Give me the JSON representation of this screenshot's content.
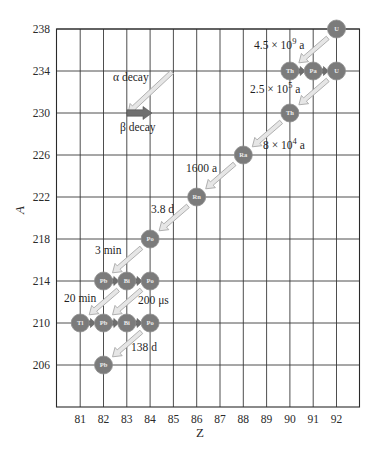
{
  "chart_data": {
    "type": "diagram",
    "xlabel": "Z",
    "ylabel": "A",
    "x_ticks": [
      81,
      82,
      83,
      84,
      85,
      86,
      87,
      88,
      89,
      90,
      91,
      92
    ],
    "y_ticks": [
      238,
      234,
      230,
      226,
      222,
      218,
      214,
      210,
      206
    ],
    "xlim": [
      80,
      93
    ],
    "ylim": [
      202,
      238
    ],
    "legend": {
      "alpha_label": "α decay",
      "beta_label": "β decay"
    },
    "nuclides": [
      {
        "symbol": "U",
        "Z": 92,
        "A": 238
      },
      {
        "symbol": "Th",
        "Z": 90,
        "A": 234
      },
      {
        "symbol": "Pa",
        "Z": 91,
        "A": 234
      },
      {
        "symbol": "U",
        "Z": 92,
        "A": 234
      },
      {
        "symbol": "Th",
        "Z": 90,
        "A": 230
      },
      {
        "symbol": "Ra",
        "Z": 88,
        "A": 226
      },
      {
        "symbol": "Rn",
        "Z": 86,
        "A": 222
      },
      {
        "symbol": "Po",
        "Z": 84,
        "A": 218
      },
      {
        "symbol": "Pb",
        "Z": 82,
        "A": 214
      },
      {
        "symbol": "Bi",
        "Z": 83,
        "A": 214
      },
      {
        "symbol": "Po",
        "Z": 84,
        "A": 214
      },
      {
        "symbol": "Tl",
        "Z": 81,
        "A": 210
      },
      {
        "symbol": "Pb",
        "Z": 82,
        "A": 210
      },
      {
        "symbol": "Bi",
        "Z": 83,
        "A": 210
      },
      {
        "symbol": "Po",
        "Z": 84,
        "A": 210
      },
      {
        "symbol": "Pb",
        "Z": 82,
        "A": 206
      }
    ],
    "alpha_decays": [
      {
        "from": [
          92,
          238
        ],
        "to": [
          90,
          234
        ],
        "half_life": "4.5 × 10⁹ a"
      },
      {
        "from": [
          92,
          234
        ],
        "to": [
          90,
          230
        ],
        "half_life": "2.5 × 10⁵ a"
      },
      {
        "from": [
          90,
          230
        ],
        "to": [
          88,
          226
        ],
        "half_life": "8 × 10⁴ a"
      },
      {
        "from": [
          88,
          226
        ],
        "to": [
          86,
          222
        ],
        "half_life": "1600 a"
      },
      {
        "from": [
          86,
          222
        ],
        "to": [
          84,
          218
        ],
        "half_life": "3.8 d"
      },
      {
        "from": [
          84,
          218
        ],
        "to": [
          82,
          214
        ],
        "half_life": "3 min"
      },
      {
        "from": [
          83,
          214
        ],
        "to": [
          81,
          210
        ],
        "half_life": "20 min"
      },
      {
        "from": [
          84,
          214
        ],
        "to": [
          82,
          210
        ],
        "half_life": "200 μs"
      },
      {
        "from": [
          84,
          210
        ],
        "to": [
          82,
          206
        ],
        "half_life": "138 d"
      }
    ],
    "beta_decays": [
      {
        "from": [
          90,
          234
        ],
        "to": [
          91,
          234
        ]
      },
      {
        "from": [
          91,
          234
        ],
        "to": [
          92,
          234
        ]
      },
      {
        "from": [
          82,
          214
        ],
        "to": [
          83,
          214
        ]
      },
      {
        "from": [
          83,
          214
        ],
        "to": [
          84,
          214
        ]
      },
      {
        "from": [
          81,
          210
        ],
        "to": [
          82,
          210
        ]
      },
      {
        "from": [
          82,
          210
        ],
        "to": [
          83,
          210
        ]
      },
      {
        "from": [
          83,
          210
        ],
        "to": [
          84,
          210
        ]
      }
    ],
    "half_life_labels": [
      {
        "text": "4.5 × 10",
        "sup": "9",
        "unit": " a",
        "x": 254,
        "y": 49
      },
      {
        "text": "2.5 × 10",
        "sup": "5",
        "unit": " a",
        "x": 250,
        "y": 93
      },
      {
        "text": "8 × 10",
        "sup": "4",
        "unit": " a",
        "x": 263,
        "y": 149
      },
      {
        "text": "1600 a",
        "sup": "",
        "unit": "",
        "x": 186,
        "y": 172
      },
      {
        "text": "3.8 d",
        "sup": "",
        "unit": "",
        "x": 151,
        "y": 213
      },
      {
        "text": "3 min",
        "sup": "",
        "unit": "",
        "x": 95,
        "y": 254
      },
      {
        "text": "20 min",
        "sup": "",
        "unit": "",
        "x": 64,
        "y": 302
      },
      {
        "text": "200 μs",
        "sup": "",
        "unit": "",
        "x": 138,
        "y": 304
      },
      {
        "text": "138 d",
        "sup": "",
        "unit": "",
        "x": 131,
        "y": 351
      }
    ]
  },
  "colors": {
    "node_fill": "#7b7b7b",
    "node_stroke": "#8e8e8e",
    "alpha_arrow_fill": "#e6e6e6",
    "alpha_arrow_stroke": "#a8a8a8",
    "beta_arrow_fill": "#6f6f6f",
    "grid": "#3a3a3a"
  }
}
